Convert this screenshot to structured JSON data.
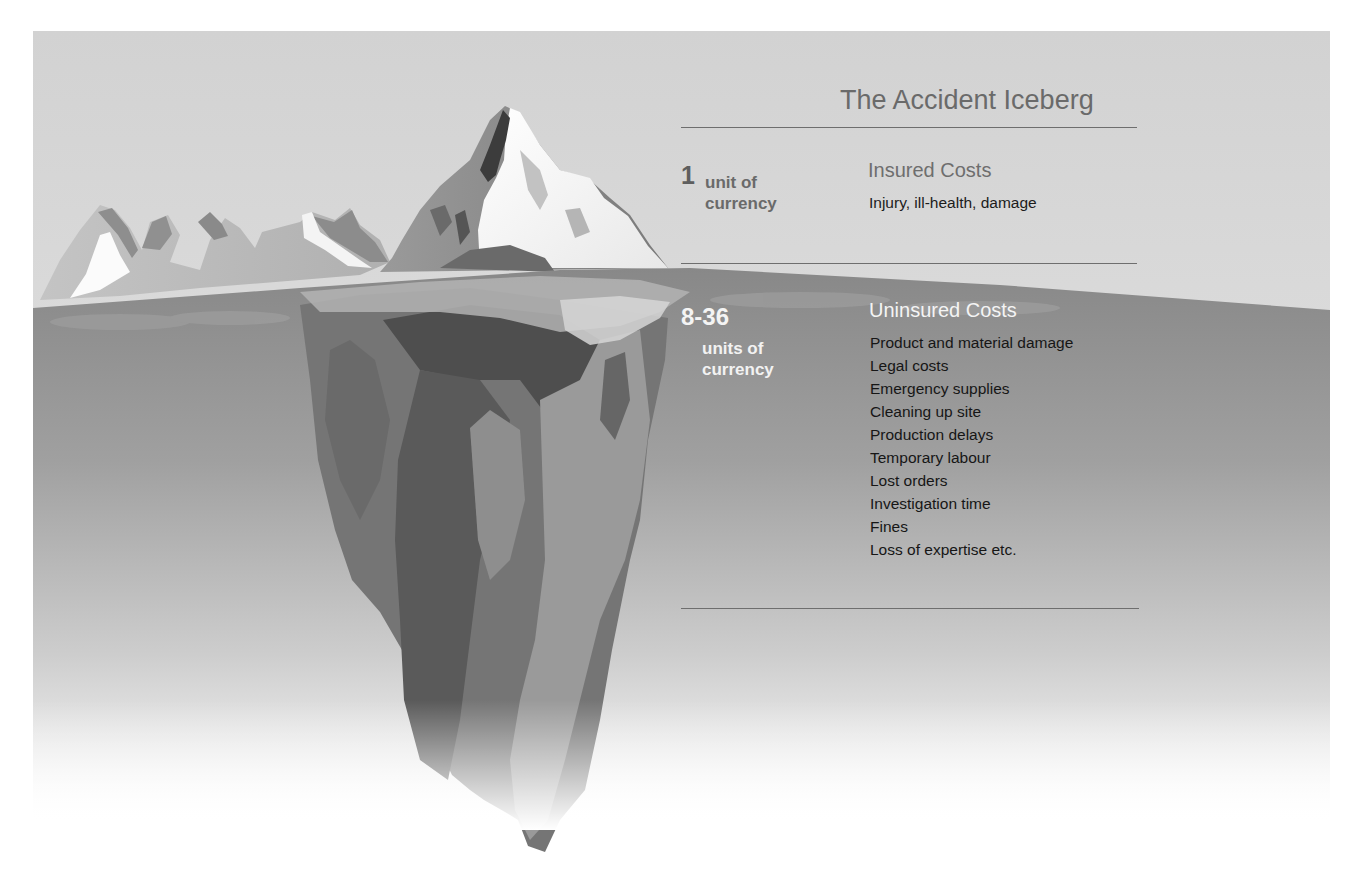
{
  "title": "The Accident Iceberg",
  "colors": {
    "sky": "#d3d3d3",
    "water_top": "#8a8a8a",
    "water_bottom": "#ffffff",
    "rule": "#6e6e6e",
    "heading_gray": "#6e6e6e",
    "body_text": "#1c1c1c",
    "underwater_heading": "#f4f4f4"
  },
  "insured": {
    "amount": "1",
    "unit": "unit of currency",
    "heading": "Insured Costs",
    "description": "Injury, ill-health, damage"
  },
  "uninsured": {
    "amount": "8-36",
    "unit": "units of currency",
    "heading": "Uninsured Costs",
    "items": [
      "Product and material damage",
      "Legal costs",
      "Emergency supplies",
      "Cleaning up site",
      "Production delays",
      "Temporary labour",
      "Lost orders",
      "Investigation time",
      "Fines",
      "Loss of expertise etc."
    ]
  },
  "illustration": {
    "subject": "iceberg-above-and-below-waterline",
    "above_water_label": "insured",
    "below_water_label": "uninsured",
    "cost_ratio": "1 : 8-36"
  }
}
